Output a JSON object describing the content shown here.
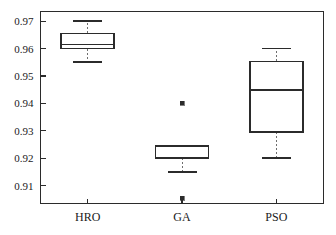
{
  "chart_data": {
    "type": "box",
    "title": "",
    "xlabel": "",
    "ylabel": "",
    "categories": [
      "HRO",
      "GA",
      "PSO"
    ],
    "ylim": [
      0.9035,
      0.9735
    ],
    "yticks": [
      0.91,
      0.92,
      0.93,
      0.94,
      0.95,
      0.96,
      0.97
    ],
    "ytick_labels": [
      "0.91",
      "0.92",
      "0.93",
      "0.94",
      "0.95",
      "0.96",
      "0.97"
    ],
    "grid": false,
    "legend": null,
    "boxes": [
      {
        "name": "HRO",
        "whisker_low": 0.955,
        "q1": 0.96,
        "median": 0.9615,
        "q3": 0.9655,
        "whisker_high": 0.97,
        "outliers": []
      },
      {
        "name": "GA",
        "whisker_low": 0.915,
        "q1": 0.92,
        "median": 0.92,
        "q3": 0.9246,
        "whisker_high": 0.9246,
        "outliers": [
          0.94,
          0.9055
        ]
      },
      {
        "name": "PSO",
        "whisker_low": 0.92,
        "q1": 0.9296,
        "median": 0.945,
        "q3": 0.9553,
        "whisker_high": 0.96,
        "outliers": []
      }
    ]
  },
  "colors": {
    "axis": "#2b2b2b",
    "box_line": "#2b2b2b",
    "whisker_line": "#6e6e6e",
    "outlier": "#2b2b2b",
    "background": "#ffffff"
  },
  "axis": {
    "y_labels": [
      "0.97",
      "0.96",
      "0.95",
      "0.94",
      "0.93",
      "0.92",
      "0.91"
    ],
    "x_labels": [
      "HRO",
      "GA",
      "PSO"
    ]
  }
}
